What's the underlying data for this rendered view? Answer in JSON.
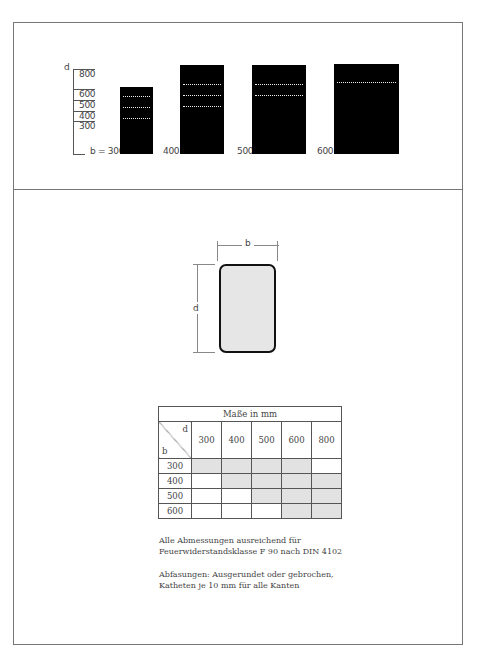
{
  "top_diagram": {
    "axis_label_d": "d",
    "d_scale": [
      "800",
      "600",
      "500",
      "400",
      "300"
    ],
    "columns": [
      {
        "b_label": "b = 300",
        "stripes": 3
      },
      {
        "b_label": "400",
        "stripes": 3
      },
      {
        "b_label": "500",
        "stripes": 2
      },
      {
        "b_label": "600",
        "stripes": 1
      }
    ]
  },
  "cross_section": {
    "width_label": "b",
    "depth_label": "d",
    "fill_color": "#e6e6e6"
  },
  "table": {
    "title": "Maße in mm",
    "corner_d": "d",
    "corner_b": "b",
    "d_values": [
      "300",
      "400",
      "500",
      "600",
      "800"
    ],
    "rows": [
      {
        "b": "300",
        "sufficient": [
          true,
          true,
          true,
          true,
          false
        ]
      },
      {
        "b": "400",
        "sufficient": [
          false,
          true,
          true,
          true,
          true
        ]
      },
      {
        "b": "500",
        "sufficient": [
          false,
          false,
          true,
          true,
          true
        ]
      },
      {
        "b": "600",
        "sufficient": [
          false,
          false,
          false,
          true,
          true
        ]
      }
    ],
    "shade_color": "#e2e2e2"
  },
  "notes": {
    "note1": "Alle Abmessungen ausreichend für Feuerwiderstandsklasse F 90 nach DIN 4102",
    "note2": "Abfasungen: Ausgerundet oder gebrochen, Katheten je 10 mm für alle Kanten"
  }
}
